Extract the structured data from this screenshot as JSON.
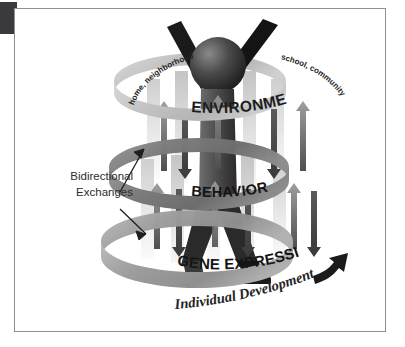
{
  "figure": {
    "rings": [
      {
        "id": "environment",
        "label": "ENVIRONMENT",
        "tone": "#c9c9c9"
      },
      {
        "id": "behavior",
        "label": "BEHAVIOR",
        "tone": "#7d7d7d"
      },
      {
        "id": "gene-expression",
        "label": "GENE EXPRESSION",
        "tone": "#a0a0a0"
      }
    ],
    "curved_labels": {
      "left": "home, neighborhood",
      "right": "school, community"
    },
    "callout": {
      "line1": "Bidirectional",
      "line2": "Exchanges"
    },
    "axis_label": "Individual Development",
    "colors": {
      "background": "#ffffff",
      "frame_border": "#8f9094",
      "corner_block": "#3a3a3c",
      "text": "#2b2b2b",
      "ring_light": "#c9c9c9",
      "ring_mid": "#7d7d7d",
      "ring_low": "#a0a0a0",
      "figure_dark": "#1c1c1c",
      "arrow_dark": "#4a4a4a"
    },
    "elements": {
      "human_figure": "human-silhouette",
      "arrow_pairs": "bidirectional-arrow-pairs",
      "development_arrow": "curved-up-right-arrow"
    }
  }
}
